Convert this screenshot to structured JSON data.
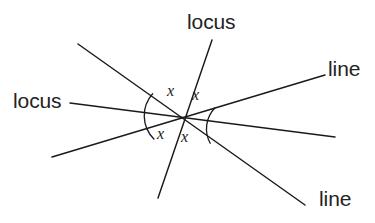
{
  "figure": {
    "background_color": "#ffffff",
    "stroke_color": "#1a1a1a",
    "text_color": "#232323",
    "width": 375,
    "height": 223,
    "intersection_point": {
      "x": 185,
      "y": 117
    }
  },
  "labels": {
    "locus_left": "locus",
    "locus_top": "locus",
    "line_right": "line",
    "line_bottom": "line"
  },
  "angle_labels": {
    "top_left": "x",
    "top_right": "x",
    "bottom_left": "x",
    "bottom_right": "x"
  },
  "lines": [
    {
      "name": "locus-horizontal",
      "label": "locus",
      "x1": 70,
      "y1": 103,
      "x2": 335,
      "y2": 137
    },
    {
      "name": "line-nw-se",
      "label": "line",
      "x1": 78,
      "y1": 44,
      "x2": 305,
      "y2": 205
    },
    {
      "name": "line-sw-ne",
      "label": "line",
      "x1": 52,
      "y1": 157,
      "x2": 325,
      "y2": 75
    },
    {
      "name": "locus-steep",
      "label": "locus",
      "x1": 212,
      "y1": 40,
      "x2": 158,
      "y2": 198
    }
  ],
  "leaders": [
    {
      "name": "leader-locus-left",
      "x1": 70,
      "y1": 103,
      "x2": 70,
      "y2": 103
    }
  ],
  "arcs": {
    "left": {
      "name": "left-angle-arc",
      "radius": 33,
      "path": "M 152.6 93.7 A 33 33 0 0 0 153.9 139.0"
    },
    "right": {
      "name": "right-angle-arc",
      "radius": 30,
      "path": "M 214.8 108.0 A 30 30 0 0 0 210.2 143.2"
    }
  }
}
